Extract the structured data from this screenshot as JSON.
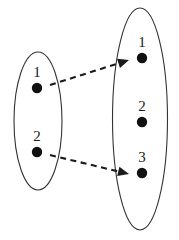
{
  "diagram": {
    "type": "set-mapping-diagram",
    "background_color": "#ffffff",
    "stroke_color": "#333333",
    "fill_color": "#111111",
    "domain_set": {
      "name": "domain-set",
      "ellipse": {
        "cx": 38,
        "cy": 121,
        "rx": 24,
        "ry": 69
      },
      "elements": [
        {
          "label": "1",
          "dot_x": 37,
          "dot_y": 88,
          "label_x": 37,
          "label_y": 77
        },
        {
          "label": "2",
          "dot_x": 37,
          "dot_y": 152,
          "label_x": 37,
          "label_y": 141
        }
      ]
    },
    "codomain_set": {
      "name": "codomain-set",
      "ellipse": {
        "cx": 140,
        "cy": 119,
        "rx": 27.5,
        "ry": 111
      },
      "elements": [
        {
          "label": "1",
          "dot_x": 142,
          "dot_y": 58,
          "label_x": 142,
          "label_y": 47
        },
        {
          "label": "2",
          "dot_x": 142,
          "dot_y": 122,
          "label_x": 142,
          "label_y": 111
        },
        {
          "label": "3",
          "dot_x": 142,
          "dot_y": 173,
          "label_x": 142,
          "label_y": 162
        }
      ]
    },
    "mappings": [
      {
        "name": "arrow-1-to-1",
        "from": "1",
        "to": "1",
        "x1": 50,
        "y1": 85,
        "x2": 129,
        "y2": 60,
        "style": "dashed",
        "arrowhead": true
      },
      {
        "name": "arrow-2-to-3",
        "from": "2",
        "to": "3",
        "x1": 50,
        "y1": 155,
        "x2": 129,
        "y2": 174,
        "style": "dashed",
        "arrowhead": true
      }
    ],
    "dot_radius": 5.2
  }
}
